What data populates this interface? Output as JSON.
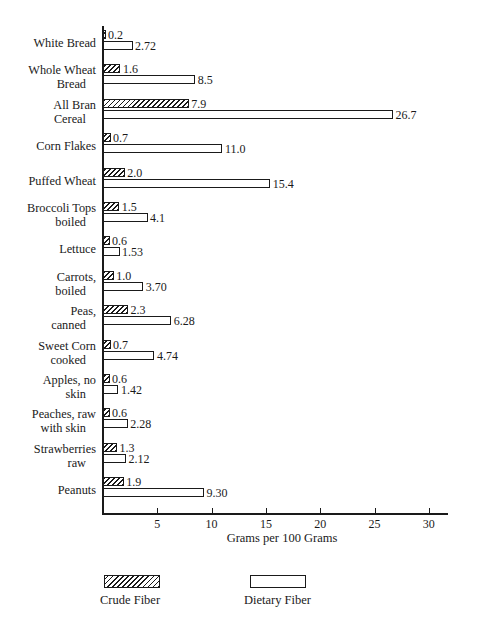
{
  "chart_data": {
    "type": "bar",
    "orientation": "horizontal",
    "title": "",
    "xlabel": "Grams per 100 Grams",
    "ylabel": "",
    "xlim": [
      0,
      32
    ],
    "xticks": [
      5,
      10,
      15,
      20,
      25,
      30
    ],
    "grid": false,
    "legend_position": "bottom",
    "categories": [
      "White Bread",
      "Whole Wheat Bread",
      "All Bran Cereal",
      "Corn  Flakes",
      "Puffed Wheat",
      "Broccoli Tops boiled",
      "Lettuce",
      "Carrots, boiled",
      "Peas, canned",
      "Sweet Corn cooked",
      "Apples, no skin",
      "Peaches, raw with skin",
      "Strawberries raw",
      "Peanuts"
    ],
    "series": [
      {
        "name": "Crude Fiber",
        "values": [
          0.2,
          1.6,
          7.9,
          0.7,
          2.0,
          1.5,
          0.6,
          1.0,
          2.3,
          0.7,
          0.6,
          0.6,
          1.3,
          1.9
        ],
        "labels": [
          "0.2",
          "1.6",
          "7.9",
          "0.7",
          "2.0",
          "1.5",
          "0.6",
          "1.0",
          "2.3",
          "0.7",
          "0.6",
          "0.6",
          "1.3",
          "1.9"
        ],
        "fill": "hatched"
      },
      {
        "name": "Dietary Fiber",
        "values": [
          2.72,
          8.5,
          26.7,
          11.0,
          15.4,
          4.1,
          1.53,
          3.7,
          6.28,
          4.74,
          1.42,
          2.28,
          2.12,
          9.3
        ],
        "labels": [
          "2.72",
          "8.5",
          "26.7",
          "11.0",
          "15.4",
          "4.1",
          "1.53",
          "3.70",
          "6.28",
          "4.74",
          "1.42",
          "2.28",
          "2.12",
          "9.30"
        ],
        "fill": "open"
      }
    ]
  },
  "category_label_lines": [
    [
      "White Bread",
      ""
    ],
    [
      "Whole Wheat",
      "Bread"
    ],
    [
      "All Bran",
      "Cereal"
    ],
    [
      "Corn  Flakes",
      ""
    ],
    [
      "Puffed Wheat",
      ""
    ],
    [
      "Broccoli Tops",
      "boiled"
    ],
    [
      "Lettuce",
      ""
    ],
    [
      "Carrots,",
      "boiled"
    ],
    [
      "Peas,",
      "canned"
    ],
    [
      "Sweet Corn",
      "cooked"
    ],
    [
      "Apples, no",
      "skin"
    ],
    [
      "Peaches, raw",
      "with skin"
    ],
    [
      "Strawberries",
      "raw"
    ],
    [
      "Peanuts",
      ""
    ]
  ],
  "axis": {
    "tick_labels": [
      "5",
      "10",
      "15",
      "20",
      "25",
      "30"
    ],
    "title": "Grams per 100 Grams"
  },
  "legend": {
    "items": [
      {
        "label": "Crude Fiber",
        "fill": "hatched"
      },
      {
        "label": "Dietary Fiber",
        "fill": "open"
      }
    ]
  },
  "colors": {
    "ink": "#1a1a1a",
    "paper": "#ffffff"
  }
}
